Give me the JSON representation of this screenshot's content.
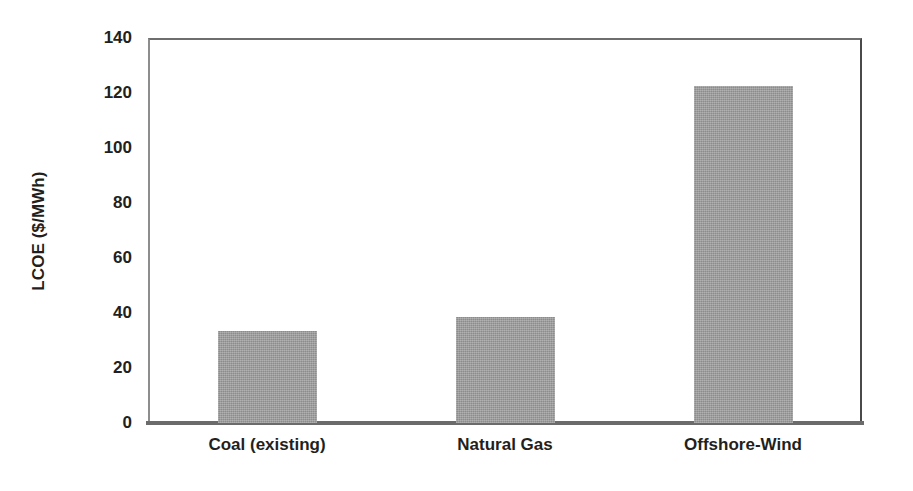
{
  "chart_data": {
    "type": "bar",
    "title": "",
    "xlabel": "",
    "ylabel": "LCOE ($/MWh)",
    "categories": [
      "Coal (existing)",
      "Natural Gas",
      "Offshore-Wind"
    ],
    "values": [
      33.5,
      38.5,
      122.5
    ],
    "series": [
      {
        "name": "LCOE",
        "values": [
          33.5,
          38.5,
          122.5
        ],
        "color": "#9b9b9b"
      }
    ],
    "ylim": [
      0,
      140
    ],
    "ytick_labels": [
      "0",
      "20",
      "40",
      "60",
      "80",
      "100",
      "120",
      "140"
    ],
    "ytick_values": [
      0,
      20,
      40,
      60,
      80,
      100,
      120,
      140
    ],
    "grid": false,
    "legend": "none",
    "bar_color": "#9b9b9b",
    "axis_color": "#6b6b6b",
    "background_color": "#ffffff"
  }
}
